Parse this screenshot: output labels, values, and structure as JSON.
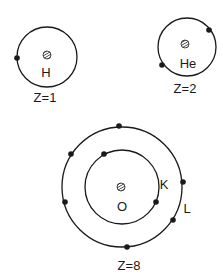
{
  "diagram": {
    "type": "bohr-atom-models",
    "colors": {
      "line": "#1a1a1a",
      "background": "#ffffff"
    },
    "atoms": [
      {
        "symbol": "H",
        "caption": "Z=1",
        "shells": [
          {
            "label": "",
            "electrons": 1
          }
        ]
      },
      {
        "symbol": "He",
        "caption": "Z=2",
        "shells": [
          {
            "label": "",
            "electrons": 2
          }
        ]
      },
      {
        "symbol": "O",
        "caption": "Z=8",
        "shells": [
          {
            "label": "K",
            "electrons": 2
          },
          {
            "label": "L",
            "electrons": 6
          }
        ]
      }
    ]
  }
}
